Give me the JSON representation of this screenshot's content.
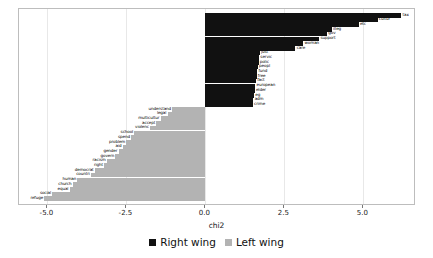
{
  "chart_data": {
    "type": "bar",
    "orientation": "horizontal",
    "title": "",
    "xlabel": "chi2",
    "ylabel": "",
    "xlim": [
      -5.9,
      6.6
    ],
    "xticks": [
      -5.0,
      -2.5,
      0.0,
      2.5,
      5.0
    ],
    "xtick_labels": [
      "-5.0",
      "-2.5",
      "0.0",
      "2.5",
      "5.0"
    ],
    "grid": true,
    "legend_position": "bottom",
    "legend": [
      {
        "name": "Right wing",
        "color": "#111111"
      },
      {
        "name": "Left wing",
        "color": "#b3b3b3"
      }
    ],
    "series": [
      {
        "name": "Right wing",
        "color": "#111111",
        "categories": [
          "tax",
          "cultur",
          "etc",
          "illeg",
          "gov",
          "support",
          "woman",
          "care",
          "just",
          "servic",
          "polic",
          "peopl",
          "fund",
          "free",
          "fact",
          "european",
          "elder",
          "eg",
          "adm",
          "crime"
        ],
        "values": [
          6.2,
          5.45,
          4.85,
          4.0,
          3.85,
          3.6,
          3.1,
          2.85,
          1.72,
          1.7,
          1.68,
          1.66,
          1.64,
          1.62,
          1.6,
          1.58,
          1.56,
          1.54,
          1.52,
          1.5
        ]
      },
      {
        "name": "Left wing",
        "color": "#b3b3b3",
        "categories": [
          "understand",
          "legal",
          "multicultur",
          "accept",
          "violenc",
          "school",
          "spend",
          "problem",
          "aid",
          "gender",
          "govern",
          "racism",
          "right",
          "democrat",
          "countri",
          "human",
          "church",
          "equal",
          "social",
          "refuge"
        ],
        "values": [
          -1.05,
          -1.2,
          -1.42,
          -1.55,
          -1.75,
          -2.25,
          -2.35,
          -2.5,
          -2.62,
          -2.75,
          -2.85,
          -3.12,
          -3.2,
          -3.5,
          -3.62,
          -4.05,
          -4.2,
          -4.3,
          -4.85,
          -5.1
        ]
      }
    ]
  },
  "axis": {
    "x_title": "chi2",
    "ticks": [
      "-5.0",
      "-2.5",
      "0.0",
      "2.5",
      "5.0"
    ]
  },
  "legend": {
    "items": [
      {
        "label": "Right wing"
      },
      {
        "label": "Left wing"
      }
    ]
  }
}
